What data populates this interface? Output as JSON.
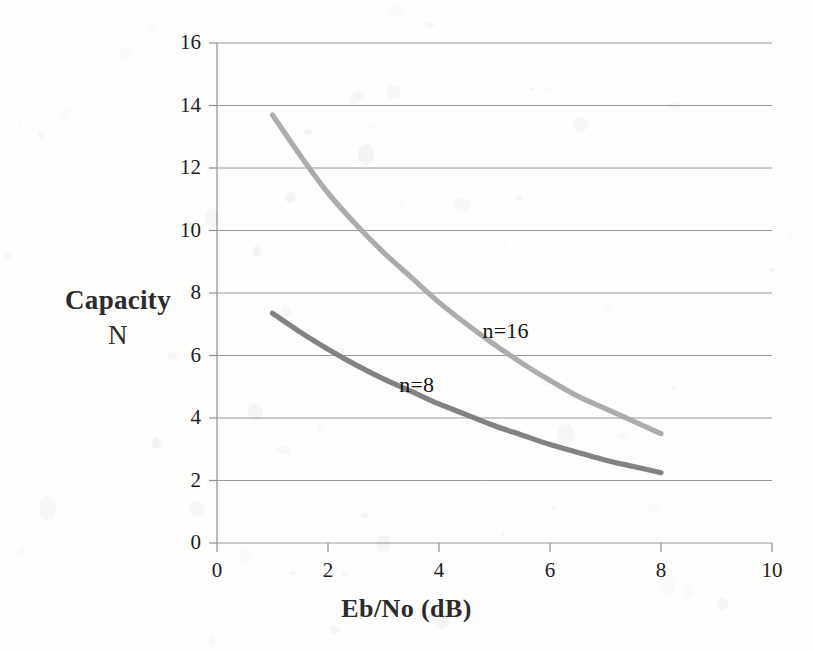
{
  "chart_data": {
    "type": "line",
    "title": "",
    "xlabel": "Eb/No (dB)",
    "ylabel": "Capacity N",
    "ylabel_line1": "Capacity",
    "ylabel_line2": "N",
    "xlim": [
      0,
      10
    ],
    "ylim": [
      0,
      16
    ],
    "xticks": [
      0,
      2,
      4,
      6,
      8,
      10
    ],
    "yticks": [
      0,
      2,
      4,
      6,
      8,
      10,
      12,
      14,
      16
    ],
    "xtick_labels": [
      "0",
      "2",
      "4",
      "6",
      "8",
      "10"
    ],
    "ytick_labels": [
      "0",
      "2",
      "4",
      "6",
      "8",
      "10",
      "12",
      "14",
      "16"
    ],
    "grid": "horizontal",
    "legend": "inline-annotations",
    "series": [
      {
        "name": "n=16",
        "label": "n=16",
        "color": "#a9a9a9",
        "x": [
          1.0,
          1.5,
          2.0,
          2.5,
          3.0,
          3.5,
          4.0,
          4.5,
          5.0,
          5.5,
          6.0,
          6.5,
          7.0,
          7.5,
          8.0
        ],
        "values": [
          13.7,
          12.4,
          11.2,
          10.2,
          9.3,
          8.5,
          7.7,
          7.0,
          6.35,
          5.75,
          5.2,
          4.7,
          4.3,
          3.9,
          3.5
        ]
      },
      {
        "name": "n=8",
        "label": "n=8",
        "color": "#7d7d7d",
        "x": [
          1.0,
          1.5,
          2.0,
          2.5,
          3.0,
          3.5,
          4.0,
          4.5,
          5.0,
          5.5,
          6.0,
          6.5,
          7.0,
          7.5,
          8.0
        ],
        "values": [
          7.35,
          6.75,
          6.2,
          5.7,
          5.25,
          4.85,
          4.45,
          4.1,
          3.75,
          3.45,
          3.15,
          2.9,
          2.65,
          2.45,
          2.25
        ]
      }
    ],
    "annotations": [
      {
        "text": "n=16",
        "x": 5.0,
        "y": 6.8
      },
      {
        "text": "n=8",
        "x": 3.5,
        "y": 5.05
      }
    ]
  }
}
